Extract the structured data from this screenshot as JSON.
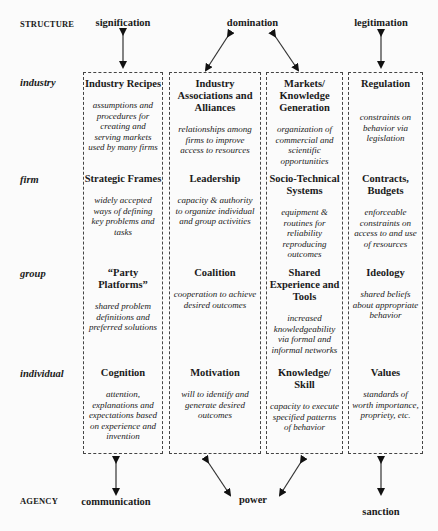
{
  "axes": {
    "top_label": "STRUCTURE",
    "bottom_label": "AGENCY"
  },
  "structure_dimensions": [
    "signification",
    "domination",
    "legitimation"
  ],
  "agency_dimensions": [
    "communication",
    "power",
    "sanction"
  ],
  "levels": [
    "industry",
    "firm",
    "group",
    "individual"
  ],
  "columns": [
    {
      "cells": [
        {
          "title": "Industry Recipes",
          "desc": "assumptions and procedures for creating and serving markets used by many firms"
        },
        {
          "title": "Strategic Frames",
          "desc": "widely accepted ways of defining key problems and tasks"
        },
        {
          "title": "“Party Platforms”",
          "desc": "shared problem definitions and preferred solutions"
        },
        {
          "title": "Cognition",
          "desc": "attention, explanations and expectations based on experience and invention"
        }
      ]
    },
    {
      "cells": [
        {
          "title": "Industry Associations and Alliances",
          "desc": "relationships among firms to improve access to resources"
        },
        {
          "title": "Leadership",
          "desc": "capacity & authority to organize individual and group activities"
        },
        {
          "title": "Coalition",
          "desc": "cooperation to achieve desired outcomes"
        },
        {
          "title": "Motivation",
          "desc": "will to identify and generate desired outcomes"
        }
      ]
    },
    {
      "cells": [
        {
          "title": "Markets/ Knowledge Generation",
          "desc": "organization of commercial and scientific opportunities"
        },
        {
          "title": "Socio-Technical Systems",
          "desc": "equipment & routines for reliability reproducing outcomes"
        },
        {
          "title": "Shared Experience and Tools",
          "desc": "increased knowledgeability via formal and informal networks"
        },
        {
          "title": "Knowledge/ Skill",
          "desc": "capacity to execute specified patterns of behavior"
        }
      ]
    },
    {
      "cells": [
        {
          "title": "Regulation",
          "desc": "constraints on behavior via legislation"
        },
        {
          "title": "Contracts, Budgets",
          "desc": "enforceable constraints on access to and use of resources"
        },
        {
          "title": "Ideology",
          "desc": "shared beliefs about appropriate behavior"
        },
        {
          "title": "Values",
          "desc": "standards of worth importance, propriety, etc."
        }
      ]
    }
  ]
}
